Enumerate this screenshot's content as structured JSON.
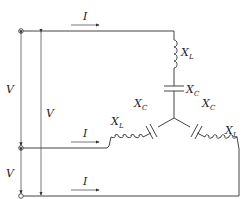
{
  "diagram": {
    "type": "three-phase Y-connected load circuit",
    "labels": {
      "current_top": "I",
      "current_middle": "I",
      "current_bottom": "I",
      "voltage_top_middle": "V",
      "voltage_middle_bottom": "V",
      "voltage_top_bottom": "V",
      "top_inductor": {
        "main": "X",
        "sub": "L"
      },
      "top_capacitor": {
        "main": "X",
        "sub": "C"
      },
      "left_capacitor": {
        "main": "X",
        "sub": "C"
      },
      "left_inductor": {
        "main": "X",
        "sub": "L"
      },
      "right_capacitor": {
        "main": "X",
        "sub": "C"
      },
      "right_inductor": {
        "main": "X",
        "sub": "L"
      }
    },
    "colors": {
      "line": "#444444",
      "text": "#222222",
      "background": "#ffffff"
    }
  }
}
